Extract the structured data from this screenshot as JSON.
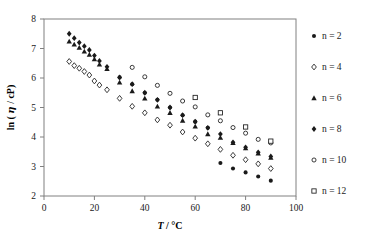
{
  "chart_data": {
    "type": "scatter",
    "title": "",
    "xlabel": "T / °C",
    "ylabel": "ln ( η / cP)",
    "xlim": [
      0,
      100
    ],
    "ylim": [
      2,
      8
    ],
    "xticks": [
      0,
      20,
      40,
      60,
      80,
      100
    ],
    "yticks": [
      2,
      3,
      4,
      5,
      6,
      7,
      8
    ],
    "grid": false,
    "legend_position": "right",
    "series": [
      {
        "name": "n = 2",
        "marker": "filled-circle",
        "color": "#1a1a1a",
        "points": [
          [
            30,
            6.02
          ],
          [
            35,
            5.79
          ],
          [
            40,
            5.5
          ],
          [
            45,
            5.26
          ],
          [
            50,
            5.0
          ],
          [
            55,
            4.74
          ],
          [
            60,
            4.52
          ],
          [
            65,
            4.31
          ],
          [
            70,
            3.12
          ],
          [
            75,
            2.93
          ],
          [
            80,
            2.8
          ],
          [
            85,
            2.66
          ],
          [
            90,
            2.52
          ]
        ]
      },
      {
        "name": "n = 4",
        "marker": "open-diamond",
        "color": "#1a1a1a",
        "points": [
          [
            10,
            6.56
          ],
          [
            12,
            6.42
          ],
          [
            14,
            6.33
          ],
          [
            16,
            6.22
          ],
          [
            18,
            6.1
          ],
          [
            20,
            5.9
          ],
          [
            22,
            5.76
          ],
          [
            25,
            5.6
          ],
          [
            30,
            5.31
          ],
          [
            35,
            5.04
          ],
          [
            40,
            4.82
          ],
          [
            45,
            4.58
          ],
          [
            50,
            4.4
          ],
          [
            55,
            4.17
          ],
          [
            60,
            3.96
          ],
          [
            65,
            3.77
          ],
          [
            70,
            3.58
          ],
          [
            75,
            3.38
          ],
          [
            80,
            3.23
          ],
          [
            85,
            3.09
          ],
          [
            90,
            2.93
          ]
        ]
      },
      {
        "name": "n = 6",
        "marker": "filled-triangle",
        "color": "#1a1a1a",
        "points": [
          [
            10,
            7.24
          ],
          [
            12,
            7.14
          ],
          [
            14,
            7.03
          ],
          [
            16,
            6.9
          ],
          [
            18,
            6.79
          ],
          [
            20,
            6.64
          ],
          [
            22,
            6.46
          ],
          [
            25,
            6.31
          ],
          [
            30,
            5.85
          ],
          [
            35,
            5.56
          ],
          [
            40,
            5.31
          ],
          [
            45,
            5.04
          ],
          [
            50,
            4.82
          ],
          [
            55,
            4.56
          ],
          [
            60,
            4.36
          ],
          [
            65,
            4.1
          ],
          [
            70,
            3.98
          ],
          [
            75,
            3.8
          ],
          [
            80,
            3.62
          ],
          [
            85,
            3.45
          ],
          [
            90,
            3.3
          ]
        ]
      },
      {
        "name": "n = 8",
        "marker": "filled-diamond",
        "color": "#1a1a1a",
        "points": [
          [
            10,
            7.5
          ],
          [
            12,
            7.35
          ],
          [
            14,
            7.2
          ],
          [
            16,
            7.08
          ],
          [
            18,
            6.95
          ],
          [
            20,
            6.76
          ],
          [
            22,
            6.58
          ],
          [
            25,
            6.38
          ],
          [
            30,
            6.02
          ],
          [
            35,
            5.79
          ],
          [
            40,
            5.5
          ],
          [
            45,
            5.26
          ],
          [
            50,
            5.0
          ],
          [
            55,
            4.74
          ],
          [
            60,
            4.52
          ],
          [
            65,
            4.31
          ],
          [
            70,
            4.1
          ],
          [
            75,
            3.82
          ],
          [
            80,
            3.65
          ],
          [
            85,
            3.48
          ],
          [
            90,
            3.34
          ]
        ]
      },
      {
        "name": "n = 10",
        "marker": "open-circle",
        "color": "#1a1a1a",
        "points": [
          [
            35,
            6.36
          ],
          [
            40,
            6.04
          ],
          [
            45,
            5.75
          ],
          [
            50,
            5.48
          ],
          [
            55,
            5.22
          ],
          [
            60,
            5.02
          ],
          [
            65,
            4.75
          ],
          [
            70,
            4.55
          ],
          [
            75,
            4.32
          ],
          [
            80,
            4.13
          ],
          [
            85,
            3.92
          ],
          [
            90,
            3.8
          ]
        ]
      },
      {
        "name": "n = 12",
        "marker": "open-square",
        "color": "#1a1a1a",
        "points": [
          [
            60,
            5.34
          ],
          [
            70,
            4.82
          ],
          [
            80,
            4.34
          ],
          [
            90,
            3.86
          ]
        ]
      }
    ]
  },
  "legend": {
    "items": [
      {
        "label": "n = 2",
        "marker": "filled-circle"
      },
      {
        "label": "n = 4",
        "marker": "open-diamond"
      },
      {
        "label": "n = 6",
        "marker": "filled-triangle"
      },
      {
        "label": "n = 8",
        "marker": "filled-diamond"
      },
      {
        "label": "n = 10",
        "marker": "open-circle"
      },
      {
        "label": "n = 12",
        "marker": "open-square"
      }
    ]
  },
  "axis_text": {
    "x_title_italic": "T",
    "x_title_rest": " / °C",
    "y_title_pre": "ln ( ",
    "y_title_symbol": "η",
    "y_title_post": " / cP)"
  }
}
